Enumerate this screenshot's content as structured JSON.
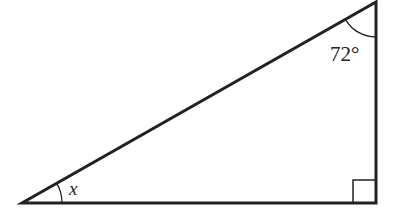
{
  "diagram": {
    "type": "right-triangle",
    "vertices": {
      "bottom_left": [
        22,
        203
      ],
      "bottom_right": [
        376,
        203
      ],
      "top_right": [
        376,
        2
      ]
    },
    "angles": {
      "top": "72°",
      "bottom_left": "x",
      "bottom_right": "right-angle"
    },
    "stroke_color": "#222222"
  }
}
